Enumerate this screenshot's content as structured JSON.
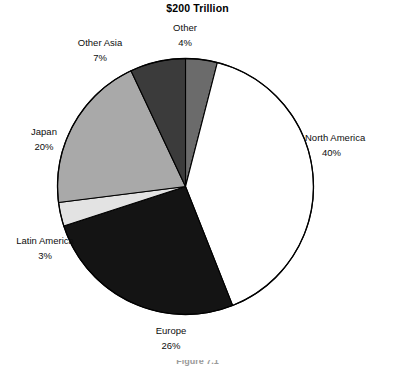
{
  "chart_data": {
    "type": "pie",
    "title": "$200 Trillion",
    "subtitle": "",
    "xlabel": "",
    "ylabel": "",
    "legend_position": "none",
    "grid": false,
    "total_label": "$200 Trillion",
    "start_angle_deg": 0,
    "direction": "clockwise",
    "categories": [
      "Other",
      "North America",
      "Europe",
      "Latin America",
      "Japan",
      "Other Asia"
    ],
    "values": [
      4,
      40,
      26,
      3,
      20,
      7
    ],
    "value_unit": "percent",
    "slices": [
      {
        "label": "Other",
        "percent": 4,
        "percent_text": "4%",
        "color": "#6b6b6b"
      },
      {
        "label": "North America",
        "percent": 40,
        "percent_text": "40%",
        "color": "#ffffff"
      },
      {
        "label": "Europe",
        "percent": 26,
        "percent_text": "26%",
        "color": "#141414"
      },
      {
        "label": "Latin America",
        "percent": 3,
        "percent_text": "3%",
        "color": "#e3e3e3"
      },
      {
        "label": "Japan",
        "percent": 20,
        "percent_text": "20%",
        "color": "#a9a9a9"
      },
      {
        "label": "Other Asia",
        "percent": 7,
        "percent_text": "7%",
        "color": "#3b3b3b"
      }
    ],
    "outline_color": "#000000"
  },
  "caption": {
    "text": "Figure 7.1"
  }
}
